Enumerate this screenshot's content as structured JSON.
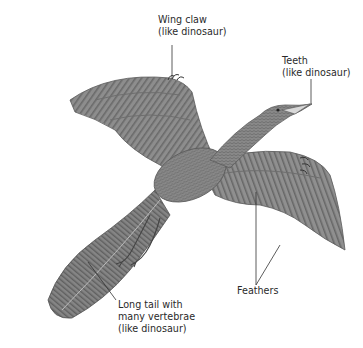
{
  "figure": {
    "colors": {
      "background": "#ffffff",
      "feather_base": "#8a8a8a",
      "feather_dark": "#5e5e5e",
      "feather_light": "#b4b4b4",
      "leader_line": "#333333",
      "text": "#2a2a2a"
    }
  },
  "labels": {
    "wing_claw": {
      "line1": "Wing claw",
      "line2": "(like dinosaur)"
    },
    "teeth": {
      "line1": "Teeth",
      "line2": "(like dinosaur)"
    },
    "feathers": {
      "line1": "Feathers"
    },
    "tail": {
      "line1": "Long tail with",
      "line2": "many vertebrae",
      "line3": "(like dinosaur)"
    }
  }
}
